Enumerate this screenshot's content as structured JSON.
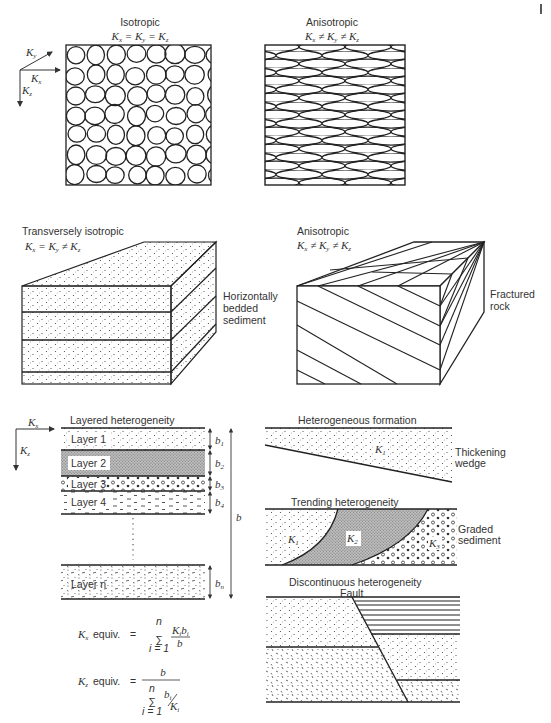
{
  "corner_mark": "|",
  "panels": {
    "isotropic": {
      "title": "Isotropic",
      "equation": "Kx = Ky = Kz",
      "axes": {
        "x": "Kx",
        "y": "Ky",
        "z": "Kz"
      },
      "pattern": "round-grains"
    },
    "anisotropic_grains": {
      "title": "Anisotropic",
      "equation": "Kx ≠ Ky ≠ Kz",
      "pattern": "elongated-grains"
    },
    "transversely_isotropic": {
      "title": "Transversely isotropic",
      "equation": "Kx = Ky ≠ Kz",
      "side_label": [
        "Horizontally",
        "bedded",
        "sediment"
      ],
      "layers": 4
    },
    "anisotropic_fractured": {
      "title": "Anisotropic",
      "equation": "Kx ≠ Ky ≠ Kz",
      "side_label": [
        "Fractured",
        "rock"
      ]
    },
    "layered": {
      "title": "Layered heterogeneity",
      "axes": {
        "x": "Kx",
        "z": "Kz"
      },
      "layers": [
        {
          "label": "Layer 1",
          "thickness": "b1",
          "fill": "sparse-dots"
        },
        {
          "label": "Layer 2",
          "thickness": "b2",
          "fill": "dense-stipple"
        },
        {
          "label": "Layer 3",
          "thickness": "b3",
          "fill": "pebbles"
        },
        {
          "label": "Layer 4",
          "thickness": "b4",
          "fill": "dashes"
        },
        {
          "label": "Layer n",
          "thickness": "bn",
          "fill": "mixed"
        }
      ],
      "total_thickness": "b",
      "formulas": {
        "kx": {
          "lhs": "Kx equiv.",
          "eq": "=",
          "sum_top": "n",
          "sum_bottom": "i = 1",
          "numerator": "Ki bi",
          "denominator": "b"
        },
        "kz": {
          "lhs": "Kz equiv.",
          "eq": "=",
          "numerator": "b",
          "sum_top": "n",
          "sum_bottom": "i = 1",
          "denominator": "bi / Ki"
        }
      }
    },
    "heterogeneous_formation": {
      "title": "Heterogeneous formation",
      "k_label": "K1",
      "side_label": [
        "Thickening",
        "wedge"
      ]
    },
    "trending": {
      "title": "Trending heterogeneity",
      "zones": [
        "K1",
        "K2",
        "K3"
      ],
      "side_label": [
        "Graded",
        "sediment"
      ]
    },
    "discontinuous": {
      "title": "Discontinuous heterogeneity",
      "fault_label": "Fault"
    }
  }
}
